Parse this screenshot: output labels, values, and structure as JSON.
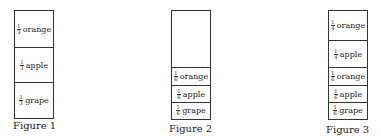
{
  "figures": [
    {
      "caption": "Figure 1",
      "cells": [
        {
          "numerator": "1",
          "denominator": "3",
          "label": "orange"
        },
        {
          "numerator": "1",
          "denominator": "3",
          "label": "apple"
        },
        {
          "numerator": "1",
          "denominator": "3",
          "label": "grape"
        }
      ]
    },
    {
      "caption": "Figure 2",
      "cells": [
        {
          "numerator": "",
          "denominator": "",
          "label": ""
        },
        {
          "numerator": "1",
          "denominator": "6",
          "label": "orange"
        },
        {
          "numerator": "1",
          "denominator": "6",
          "label": "apple"
        },
        {
          "numerator": "1",
          "denominator": "6",
          "label": "grape"
        }
      ]
    },
    {
      "caption": "Figure 3",
      "cells": [
        {
          "numerator": "1",
          "denominator": "4",
          "label": "orange"
        },
        {
          "numerator": "1",
          "denominator": "4",
          "label": "apple"
        },
        {
          "numerator": "1",
          "denominator": "6",
          "label": "orange"
        },
        {
          "numerator": "1",
          "denominator": "6",
          "label": "apple"
        },
        {
          "numerator": "1",
          "denominator": "6",
          "label": "grape"
        }
      ]
    }
  ]
}
